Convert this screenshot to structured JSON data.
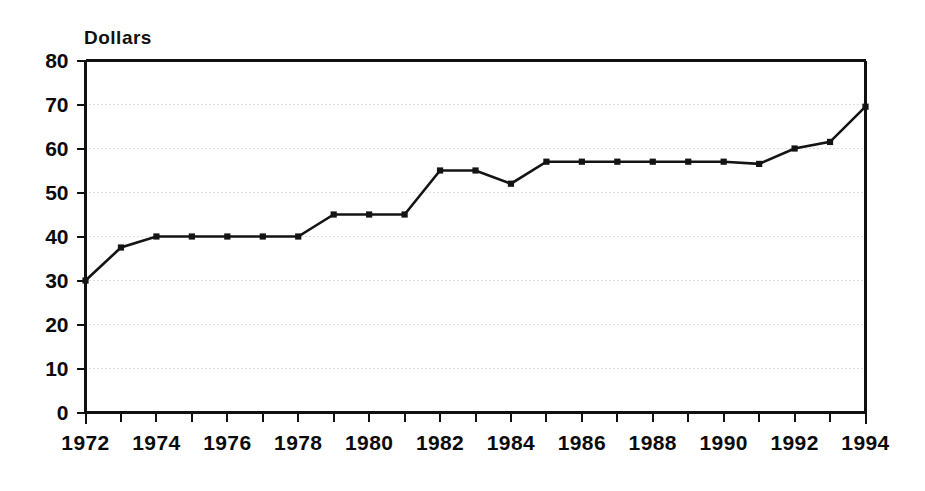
{
  "chart_data": {
    "type": "line",
    "title": "",
    "subtitle": "",
    "xlabel": "",
    "ylabel": "Dollars",
    "ylabel_position": "top-left",
    "grid": "horizontal-dotted",
    "legend": "none",
    "xlim": [
      1972,
      1994
    ],
    "ylim": [
      0,
      80
    ],
    "ytick_step": 10,
    "xtick_step_minor": 1,
    "xtick_step_major": 2,
    "x": [
      1972,
      1973,
      1974,
      1975,
      1976,
      1977,
      1978,
      1979,
      1980,
      1981,
      1982,
      1983,
      1984,
      1985,
      1986,
      1987,
      1988,
      1989,
      1990,
      1991,
      1992,
      1993,
      1994
    ],
    "values": [
      30,
      37.5,
      40,
      40,
      40,
      40,
      40,
      45,
      45,
      45,
      55,
      55,
      52,
      57,
      57,
      57,
      57,
      57,
      57,
      56.5,
      60,
      61.5,
      69.5
    ],
    "series": [
      {
        "name": "Dollars",
        "values": [
          30,
          37.5,
          40,
          40,
          40,
          40,
          40,
          45,
          45,
          45,
          55,
          55,
          52,
          57,
          57,
          57,
          57,
          57,
          57,
          56.5,
          60,
          61.5,
          69.5
        ]
      }
    ],
    "ytick_labels": [
      "0",
      "10",
      "20",
      "30",
      "40",
      "50",
      "60",
      "70",
      "80"
    ],
    "ytick_values": [
      0,
      10,
      20,
      30,
      40,
      50,
      60,
      70,
      80
    ],
    "xtick_labels": [
      "1972",
      "1974",
      "1976",
      "1978",
      "1980",
      "1982",
      "1984",
      "1986",
      "1988",
      "1990",
      "1992",
      "1994"
    ],
    "xtick_values": [
      1972,
      1974,
      1976,
      1978,
      1980,
      1982,
      1984,
      1986,
      1988,
      1990,
      1992,
      1994
    ],
    "colors": {
      "line": "#141414",
      "marker": "#141414",
      "grid": "#bdbdbd",
      "frame": "#111111",
      "text": "#0b0b0b",
      "background": "#ffffff"
    }
  }
}
